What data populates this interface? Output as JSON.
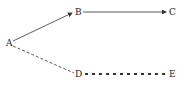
{
  "diagram": {
    "nodes": [
      {
        "id": "A",
        "label": "A",
        "x": 9,
        "y": 43
      },
      {
        "id": "B",
        "label": "B",
        "x": 78,
        "y": 12
      },
      {
        "id": "C",
        "label": "C",
        "x": 172,
        "y": 12
      },
      {
        "id": "D",
        "label": "D",
        "x": 78,
        "y": 74
      },
      {
        "id": "E",
        "label": "E",
        "x": 172,
        "y": 74
      }
    ],
    "edges": [
      {
        "from": "A",
        "to": "B",
        "style": "solid-arrow"
      },
      {
        "from": "B",
        "to": "C",
        "style": "solid-arrow"
      },
      {
        "from": "A",
        "to": "D",
        "style": "dashed"
      },
      {
        "from": "D",
        "to": "E",
        "style": "thick-dashed"
      }
    ],
    "colors": {
      "line": "#333333",
      "text": "#222222"
    }
  }
}
